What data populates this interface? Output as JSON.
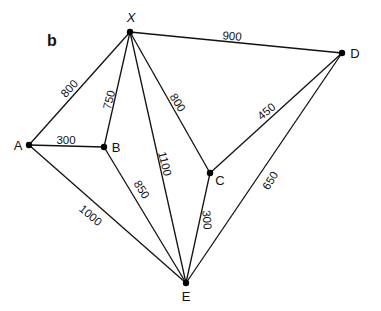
{
  "panel_label": "b",
  "nodes": [
    {
      "id": "X",
      "label": "X",
      "x": 130,
      "y": 32,
      "lx": 131,
      "ly": 22,
      "italic": true
    },
    {
      "id": "A",
      "label": "A",
      "x": 29,
      "y": 145,
      "lx": 18,
      "ly": 150
    },
    {
      "id": "B",
      "label": "B",
      "x": 104,
      "y": 147,
      "lx": 116,
      "ly": 152
    },
    {
      "id": "C",
      "label": "C",
      "x": 210,
      "y": 173,
      "lx": 220,
      "ly": 185
    },
    {
      "id": "D",
      "label": "D",
      "x": 342,
      "y": 53,
      "lx": 355,
      "ly": 58
    },
    {
      "id": "E",
      "label": "E",
      "x": 186,
      "y": 283,
      "lx": 186,
      "ly": 301
    }
  ],
  "edges": [
    {
      "from": "X",
      "to": "D",
      "weight": "900",
      "lx": 232,
      "ly": 37,
      "rot": 5
    },
    {
      "from": "X",
      "to": "A",
      "weight": "800",
      "lx": 70,
      "ly": 89,
      "rot": -48
    },
    {
      "from": "X",
      "to": "B",
      "weight": "750",
      "lx": 110,
      "ly": 100,
      "rot": -76
    },
    {
      "from": "X",
      "to": "C",
      "weight": "800",
      "lx": 177,
      "ly": 103,
      "rot": 58
    },
    {
      "from": "X",
      "to": "E",
      "weight": "1100",
      "lx": 164,
      "ly": 164,
      "rot": 76
    },
    {
      "from": "A",
      "to": "B",
      "weight": "300",
      "lx": 66,
      "ly": 141,
      "rot": 0
    },
    {
      "from": "A",
      "to": "E",
      "weight": "1000",
      "lx": 90,
      "ly": 216,
      "rot": 40
    },
    {
      "from": "B",
      "to": "E",
      "weight": "850",
      "lx": 141,
      "ly": 190,
      "rot": 58
    },
    {
      "from": "C",
      "to": "D",
      "weight": "450",
      "lx": 267,
      "ly": 112,
      "rot": -40
    },
    {
      "from": "C",
      "to": "E",
      "weight": "300",
      "lx": 206,
      "ly": 220,
      "rot": 85
    },
    {
      "from": "D",
      "to": "E",
      "weight": "650",
      "lx": 271,
      "ly": 181,
      "rot": -58
    }
  ]
}
